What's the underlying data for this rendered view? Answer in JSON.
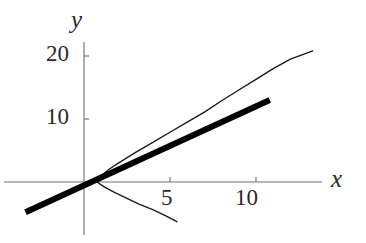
{
  "figure": {
    "title": "",
    "background_color": "#ffffff",
    "axis_color": "#6e6e6e",
    "curve_color": "#1a1a1a",
    "tangent_color": "#000000",
    "width": 366,
    "height": 243
  },
  "axes": {
    "x_axis_label": "x",
    "y_axis_label": "y",
    "x_ticks": [
      {
        "value": 5,
        "label": "5"
      },
      {
        "value": 10,
        "label": "10"
      }
    ],
    "y_ticks": [
      {
        "value": 10,
        "label": "10"
      },
      {
        "value": 20,
        "label": "20"
      }
    ]
  },
  "chart_data": {
    "type": "line",
    "title": "",
    "xlabel": "x",
    "ylabel": "y",
    "xlim": [
      -4.0,
      15.5
    ],
    "ylim": [
      -7.5,
      22.5
    ],
    "grid": false,
    "legend": "none",
    "x_ticks": [
      5,
      10
    ],
    "x_tick_labels": [
      "5",
      "10"
    ],
    "y_ticks": [
      10,
      20
    ],
    "y_tick_labels": [
      "10",
      "20"
    ],
    "origin_px": {
      "x": 84,
      "y": 182
    },
    "px_per_unit": {
      "x": 17.2,
      "y": 6.3
    },
    "series": [
      {
        "name": "curve-upper-branch",
        "style": "thin-line",
        "linewidth_px": 1.4,
        "color": "#1a1a1a",
        "points": [
          [
            0.75,
            0.0
          ],
          [
            1.0,
            1.0
          ],
          [
            1.5,
            2.1
          ],
          [
            2.0,
            3.0
          ],
          [
            3.0,
            4.7
          ],
          [
            4.0,
            6.3
          ],
          [
            5.0,
            7.9
          ],
          [
            6.0,
            9.5
          ],
          [
            7.0,
            11.1
          ],
          [
            8.0,
            12.9
          ],
          [
            9.0,
            14.6
          ],
          [
            10.0,
            16.3
          ],
          [
            11.0,
            18.0
          ],
          [
            12.0,
            19.5
          ],
          [
            13.3,
            20.8
          ]
        ]
      },
      {
        "name": "curve-lower-branch",
        "style": "thin-line",
        "linewidth_px": 1.4,
        "color": "#1a1a1a",
        "points": [
          [
            0.75,
            0.0
          ],
          [
            1.2,
            -0.8
          ],
          [
            1.8,
            -1.7
          ],
          [
            2.5,
            -2.6
          ],
          [
            3.2,
            -3.5
          ],
          [
            4.0,
            -4.4
          ],
          [
            4.7,
            -5.3
          ],
          [
            5.4,
            -6.3
          ]
        ]
      },
      {
        "name": "tangent-line",
        "style": "thick-line",
        "linewidth_px": 6,
        "color": "#000000",
        "points": [
          [
            -3.4,
            -4.8
          ],
          [
            10.8,
            13.0
          ]
        ],
        "slope": 1.26,
        "intercept": -0.52
      }
    ]
  }
}
